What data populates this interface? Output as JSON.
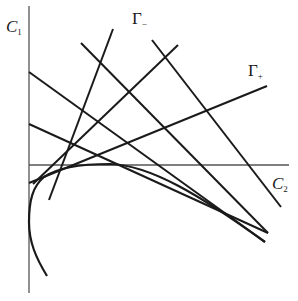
{
  "diagram": {
    "axes": {
      "vertical": {
        "label": "C",
        "subscript": "1"
      },
      "horizontal": {
        "label": "C",
        "subscript": "2"
      }
    },
    "line_labels": [
      {
        "label": "Γ",
        "subscript": "−"
      },
      {
        "label": "Γ",
        "subscript": "+"
      }
    ],
    "colors": {
      "line": "#1a1a1a",
      "axis": "#555555",
      "background": "#ffffff"
    }
  }
}
